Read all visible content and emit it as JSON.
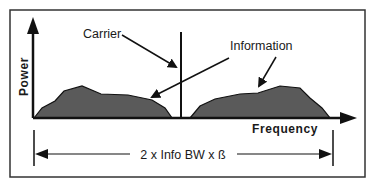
{
  "diagram": {
    "colors": {
      "ink": "#111111",
      "lobe_fill": "#5a5a5a",
      "frame": "#333333",
      "background": "#ffffff"
    },
    "axes": {
      "y_label": "Power",
      "x_label": "Frequency"
    },
    "annotations": {
      "carrier": "Carrier",
      "information": "Information"
    },
    "bandwidth_label": "2 x Info BW x ß",
    "components": [
      {
        "name": "lower-sideband",
        "type": "information-lobe"
      },
      {
        "name": "carrier",
        "type": "carrier-line"
      },
      {
        "name": "upper-sideband",
        "type": "information-lobe"
      }
    ]
  }
}
